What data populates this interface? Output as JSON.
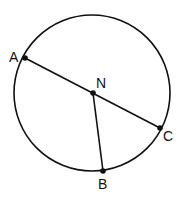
{
  "diagram": {
    "type": "geometry-circle",
    "circle": {
      "cx": 92,
      "cy": 93,
      "r": 78,
      "label": "circle N"
    },
    "center": {
      "name": "N",
      "x": 93,
      "y": 93,
      "label_x": 96,
      "label_y": 88
    },
    "points": [
      {
        "name": "A",
        "x": 25,
        "y": 58,
        "label_x": 9,
        "label_y": 62
      },
      {
        "name": "C",
        "x": 160,
        "y": 128,
        "label_x": 163,
        "label_y": 141
      },
      {
        "name": "B",
        "x": 103,
        "y": 171,
        "label_x": 98,
        "label_y": 189
      }
    ],
    "segments": [
      {
        "name": "AC",
        "from": "A",
        "to": "C",
        "kind": "diameter"
      },
      {
        "name": "NB",
        "from": "N",
        "to": "B",
        "kind": "radius"
      }
    ],
    "labels": {
      "A": "A",
      "N": "N",
      "C": "C",
      "B": "B"
    },
    "colors": {
      "stroke": "#111111",
      "background": "#ffffff"
    }
  }
}
